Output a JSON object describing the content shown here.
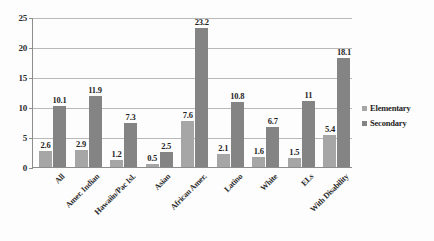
{
  "chart_data": {
    "type": "bar",
    "title": "",
    "xlabel": "",
    "ylabel": "",
    "ylim": [
      0,
      25
    ],
    "ytick_labels": [
      "0",
      "5",
      "10",
      "15",
      "20",
      "25"
    ],
    "ytick_values": [
      0,
      5,
      10,
      15,
      20,
      25
    ],
    "grid": true,
    "legend_position": "right",
    "categories": [
      "All",
      "Amer. Indian",
      "Hawaiin/Pac Isl.",
      "Asian",
      "African Amer.",
      "Latino",
      "White",
      "ELs",
      "With Disability"
    ],
    "series": [
      {
        "name": "Elementary",
        "color": "#a6a6a6",
        "values": [
          2.6,
          2.9,
          1.2,
          0.5,
          7.6,
          2.1,
          1.6,
          1.5,
          5.4
        ],
        "labels": [
          "2.6",
          "2.9",
          "1.2",
          "0.5",
          "7.6",
          "2.1",
          "1.6",
          "1.5",
          "5.4"
        ]
      },
      {
        "name": "Secondary",
        "color": "#848484",
        "values": [
          10.1,
          11.9,
          7.3,
          2.5,
          23.2,
          10.8,
          6.7,
          11,
          18.1
        ],
        "labels": [
          "10.1",
          "11.9",
          "7.3",
          "2.5",
          "23.2",
          "10.8",
          "6.7",
          "11",
          "18.1"
        ]
      }
    ]
  },
  "legend": {
    "items": [
      {
        "label": "Elementary",
        "color": "#a6a6a6"
      },
      {
        "label": "Secondary",
        "color": "#848484"
      }
    ]
  },
  "colors": {
    "axis": "#8d8d8d",
    "gridline": "#b9b9b9",
    "text": "#1f1f1f",
    "background": "#fdfdfd"
  }
}
